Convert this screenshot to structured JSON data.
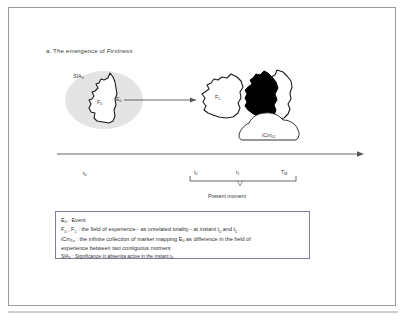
{
  "figure": {
    "caption_prefix": "a. The emergence of ",
    "caption_italic": "Firstness"
  },
  "diagram": {
    "labels": {
      "sia0": "SIA",
      "sia0_sub": "0",
      "f0": "F",
      "f0_sub": "0",
      "e0": "E",
      "e0_sub": "0",
      "f1": "F",
      "f1_sub": "1",
      "icm": "iCm",
      "icm_sub": "01"
    },
    "colors": {
      "halo_fill": "#e3e3e3",
      "outline": "#1a1a1a",
      "solid_fill": "#000000",
      "arrow": "#555555",
      "frame_border": "#9a9a9a",
      "legend_border": "#7f7f9a",
      "text": "#3a3a3a"
    }
  },
  "timeline": {
    "left_tick": "t",
    "left_tick_sub": "0",
    "ticks": [
      {
        "label": "t",
        "sub": "0"
      },
      {
        "label": "t",
        "sub": "1"
      },
      {
        "label": "T",
        "sub": "M"
      }
    ],
    "present_moment": "Present moment"
  },
  "legend": {
    "lines": [
      {
        "text": "E0  : Event",
        "html": "E<sub>0</sub> : Event",
        "small": false
      },
      {
        "text": "F0 ; F1 : the field of experience - as unrelated totality - at instant t0 and t1",
        "html": "F<sub>0</sub> ; F<sub>1</sub> : the field of experience - as unrelated totality - at instant t<sub>0</sub> and t<sub>1</sub>",
        "small": false
      },
      {
        "text": "iCm1x : the infinite collection of marker mapping E0 as difference in the field of",
        "html": "iCm<sub>1x</sub> : the infinite collection of marker mapping E<sub>0</sub> as difference in the field of",
        "small": false
      },
      {
        "text": "experience between two contiguous moment",
        "html": "experience between two contiguous moment",
        "small": false
      },
      {
        "text": "SIA0 : Significance in absentia active in the instant t0",
        "html": "SIA<sub>0</sub> : Significance in absentia active in the instant t<sub>0</sub>",
        "small": true
      }
    ]
  }
}
